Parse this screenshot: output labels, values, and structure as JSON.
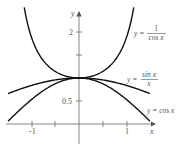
{
  "chart_data": {
    "type": "line",
    "title": "",
    "xlabel": "x",
    "ylabel": "y",
    "xlim": [
      -1.5,
      1.5
    ],
    "ylim": [
      0,
      2.5
    ],
    "grid": false,
    "legend": "inline labels next to curves",
    "x_ticks": [
      -1,
      -0.5,
      0.5,
      1
    ],
    "x_tick_labels": [
      "-1",
      "",
      "",
      "1"
    ],
    "y_ticks": [
      0.5,
      1.5,
      2
    ],
    "y_tick_labels": [
      "0.5",
      "",
      "2"
    ],
    "series": [
      {
        "name": "y = 1/cos x",
        "label_parts": {
          "lhs": "y =",
          "num": "1",
          "den": "cos x"
        },
        "function": "1/cos(x)",
        "x": [
          -1.16,
          -1.0,
          -0.75,
          -0.5,
          -0.25,
          0,
          0.25,
          0.5,
          0.75,
          1.0,
          1.16
        ],
        "values": [
          2.51,
          1.85,
          1.37,
          1.14,
          1.03,
          1.0,
          1.03,
          1.14,
          1.37,
          1.85,
          2.51
        ]
      },
      {
        "name": "y = sin x / x",
        "label_parts": {
          "lhs": "y =",
          "num": "sin x",
          "den": "x"
        },
        "function": "sin(x)/x",
        "x": [
          -1.5,
          -1.0,
          -0.5,
          0,
          0.5,
          1.0,
          1.5
        ],
        "values": [
          0.66,
          0.84,
          0.96,
          1.0,
          0.96,
          0.84,
          0.66
        ]
      },
      {
        "name": "y = cos x",
        "label_parts": {
          "text": "y = cos x"
        },
        "function": "cos(x)",
        "x": [
          -1.5,
          -1.0,
          -0.5,
          0,
          0.5,
          1.0,
          1.5
        ],
        "values": [
          0.07,
          0.54,
          0.88,
          1.0,
          0.88,
          0.54,
          0.07
        ]
      }
    ],
    "annotations": [
      "y = 1/cos x",
      "y = sin x / x",
      "y = cos x"
    ]
  },
  "axes": {
    "x_label": "x",
    "y_label": "y",
    "x_tick_neg1": "-1",
    "x_tick_pos1": "1",
    "y_tick_half": "0.5",
    "y_tick_two": "2"
  },
  "labels": {
    "sec": {
      "lhs": "y =",
      "num": "1",
      "den": "cos x"
    },
    "sinc": {
      "lhs": "y =",
      "num": "sin x",
      "den": "x"
    },
    "cos": {
      "text": "y = cos x"
    }
  },
  "colors": {
    "curve": "#111111",
    "axis": "#777777",
    "text": "#555555",
    "background": "#ffffff"
  }
}
